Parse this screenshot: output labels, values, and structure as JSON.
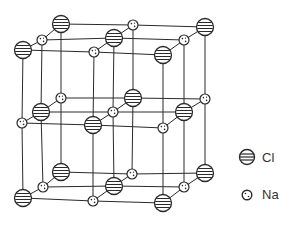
{
  "diagram": {
    "colors": {
      "line": "#2a2a2a",
      "cl_fill": "#ffffff",
      "na_fill": "#ffffff"
    },
    "atoms": [
      {
        "type": "Cl",
        "x": 23,
        "y": 50
      },
      {
        "type": "Na",
        "x": 94,
        "y": 52
      },
      {
        "type": "Cl",
        "x": 163,
        "y": 55
      },
      {
        "type": "Na",
        "x": 42,
        "y": 40
      },
      {
        "type": "Cl",
        "x": 114,
        "y": 38
      },
      {
        "type": "Na",
        "x": 184,
        "y": 40
      },
      {
        "type": "Cl",
        "x": 61,
        "y": 24
      },
      {
        "type": "Na",
        "x": 133,
        "y": 25
      },
      {
        "type": "Cl",
        "x": 205,
        "y": 27
      },
      {
        "type": "Na",
        "x": 22,
        "y": 123
      },
      {
        "type": "Cl",
        "x": 93,
        "y": 125
      },
      {
        "type": "Na",
        "x": 163,
        "y": 128
      },
      {
        "type": "Cl",
        "x": 41,
        "y": 112
      },
      {
        "type": "Na",
        "x": 113,
        "y": 112
      },
      {
        "type": "Cl",
        "x": 184,
        "y": 112
      },
      {
        "type": "Na",
        "x": 61,
        "y": 98
      },
      {
        "type": "Cl",
        "x": 133,
        "y": 98
      },
      {
        "type": "Na",
        "x": 205,
        "y": 99
      },
      {
        "type": "Cl",
        "x": 23,
        "y": 198
      },
      {
        "type": "Na",
        "x": 93,
        "y": 201
      },
      {
        "type": "Cl",
        "x": 163,
        "y": 203
      },
      {
        "type": "Na",
        "x": 43,
        "y": 187
      },
      {
        "type": "Cl",
        "x": 114,
        "y": 186
      },
      {
        "type": "Na",
        "x": 184,
        "y": 187
      },
      {
        "type": "Cl",
        "x": 61,
        "y": 172
      },
      {
        "type": "Na",
        "x": 132,
        "y": 174
      },
      {
        "type": "Cl",
        "x": 205,
        "y": 173
      }
    ]
  },
  "legend": {
    "items": [
      {
        "symbol": "Cl",
        "label": "Cl"
      },
      {
        "symbol": "Na",
        "label": "Na"
      }
    ]
  }
}
